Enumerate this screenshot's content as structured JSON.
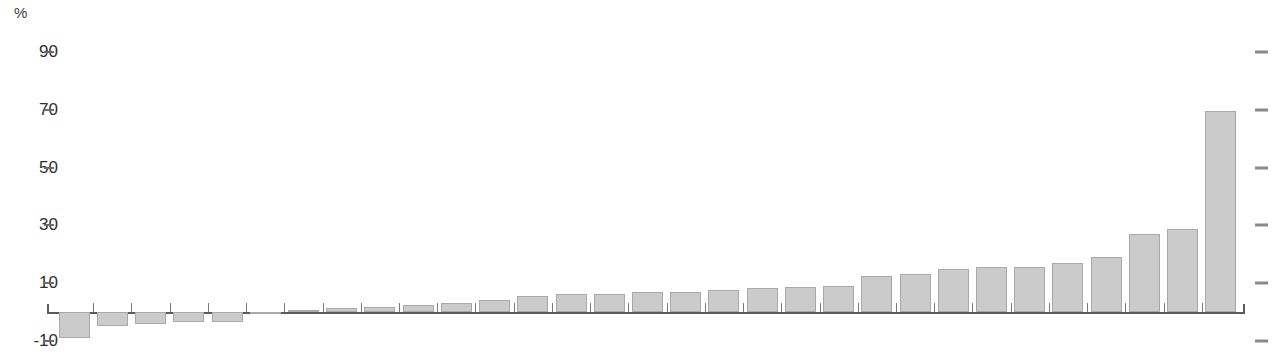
{
  "chart_data": {
    "type": "bar",
    "title": "",
    "subtitle": "",
    "xlabel": "",
    "ylabel": "%",
    "unit_label": "%",
    "ylim": [
      -12,
      95
    ],
    "ytick_labels": [
      "90",
      "70",
      "50",
      "30",
      "10",
      "-10"
    ],
    "ytick_values": [
      90,
      70,
      50,
      30,
      10,
      -10
    ],
    "grid": false,
    "legend": null,
    "categories": [
      "1",
      "2",
      "3",
      "4",
      "5",
      "6",
      "7",
      "8",
      "9",
      "10",
      "11",
      "12",
      "13",
      "14",
      "15",
      "16",
      "17",
      "18",
      "19",
      "20",
      "21",
      "22",
      "23",
      "24",
      "25",
      "26",
      "27",
      "28",
      "29",
      "30"
    ],
    "values": [
      -9.0,
      -5.0,
      -4.0,
      -3.6,
      -3.3,
      -0.4,
      0.6,
      1.4,
      1.6,
      2.4,
      3.2,
      4.2,
      5.4,
      6.2,
      6.2,
      7.0,
      7.0,
      7.6,
      8.4,
      8.8,
      9.0,
      12.4,
      13.0,
      15.0,
      15.4,
      15.6,
      17.0,
      19.2,
      27.0,
      28.6
    ],
    "last_value": 69.6,
    "bar_color": "#cbcbcb",
    "bar_border_color": "#a9a9a9",
    "axis_color": "#5b5b5b",
    "tick_color": "#7a7a7a",
    "text_color": "#2e2e2e"
  },
  "axis": {
    "unit": "%"
  }
}
